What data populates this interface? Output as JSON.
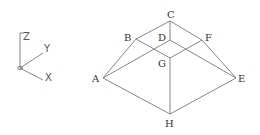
{
  "diagram": {
    "type": "isometric frustum (truncated pyramid) with axis triad",
    "line_color": "#777777",
    "axes": {
      "z_label": "Z",
      "y_label": "Y",
      "x_label": "X"
    },
    "vertices": {
      "A": "A",
      "B": "B",
      "C": "C",
      "D": "D",
      "E": "E",
      "F": "F",
      "G": "G",
      "H": "H"
    }
  }
}
